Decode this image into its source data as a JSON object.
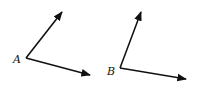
{
  "diagram": {
    "type": "two angles",
    "angles": [
      {
        "label": "A",
        "vertex": [
          26,
          58
        ],
        "ray1_end": [
          62,
          12
        ],
        "ray2_end": [
          90,
          75
        ],
        "label_pos": [
          13,
          63
        ]
      },
      {
        "label": "B",
        "vertex": [
          120,
          68
        ],
        "ray1_end": [
          141,
          12
        ],
        "ray2_end": [
          186,
          79
        ],
        "label_pos": [
          107,
          75
        ]
      }
    ],
    "stroke_color": "#111111"
  }
}
